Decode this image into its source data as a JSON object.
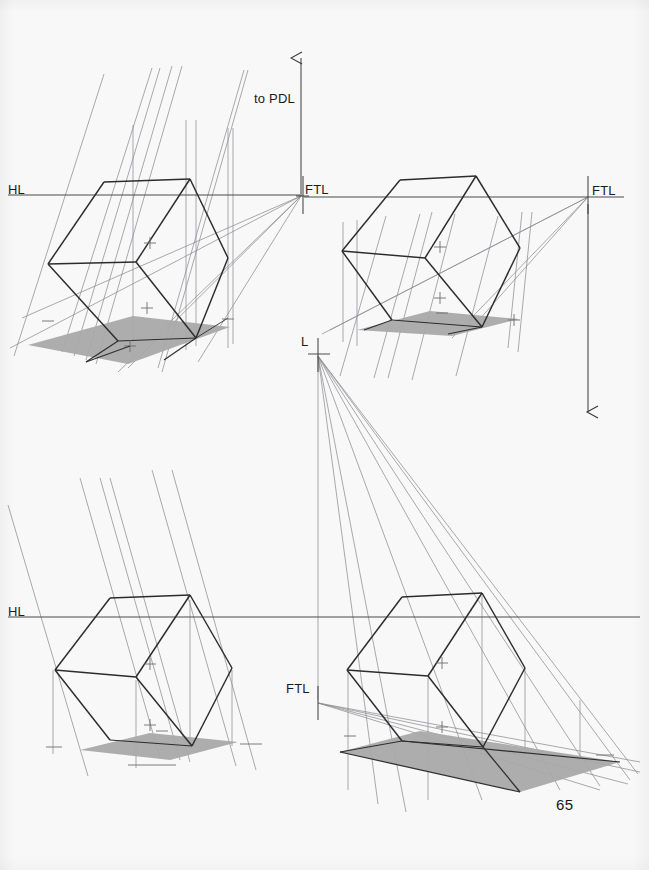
{
  "page": {
    "number": "65",
    "background_color": "#f8f8f8",
    "ink_color": "#303030",
    "construction_line_color": "#8d8d93",
    "shadow_fill_color": "#a9a9a9",
    "width": 649,
    "height": 870
  },
  "labels": {
    "hl_top_left": "HL",
    "hl_bottom_left": "HL",
    "ftl_top_left": "FTL",
    "ftl_top_right_left_edge": "FTL",
    "ftl_top_right": "FTL",
    "ftl_bottom_right": "FTL",
    "to_pdl": "to PDL",
    "light_point": "L"
  },
  "figures": [
    {
      "id": "fig-top-left",
      "name": "cube-with-cast-shadow-top-left",
      "caption_labels": [
        "HL",
        "FTL",
        "to PDL"
      ],
      "reference_lines": [
        {
          "name": "horizon-line",
          "label": "HL",
          "y": 195,
          "x1": 8,
          "x2": 300
        },
        {
          "name": "ftl-marker",
          "label": "FTL",
          "x": 301,
          "y": 195
        },
        {
          "name": "to-pdl-arrow",
          "label": "to PDL",
          "x": 301,
          "y_from": 195,
          "y_to": 52,
          "direction": "up"
        }
      ],
      "cube_vertices": {
        "top_back": [
          104,
          182
        ],
        "top_apex": [
          190,
          179
        ],
        "left": [
          48,
          264
        ],
        "center": [
          136,
          262
        ],
        "right": [
          228,
          258
        ],
        "bottom_left": [
          118,
          341
        ],
        "bottom_center": [
          196,
          338
        ],
        "bottom_right": [
          228,
          318
        ]
      },
      "shadow_polygon": [
        [
          28,
          345
        ],
        [
          133,
          316
        ],
        [
          230,
          327
        ],
        [
          128,
          364
        ]
      ]
    },
    {
      "id": "fig-top-right",
      "name": "cube-with-cast-shadow-top-right",
      "caption_labels": [
        "FTL",
        "FTL"
      ],
      "reference_lines": [
        {
          "name": "ftl-line",
          "label": "FTL",
          "y": 197,
          "x1": 304,
          "x2": 624
        },
        {
          "name": "ftl-vertical-drop-arrow",
          "x": 588,
          "y_from": 197,
          "y_to": 420,
          "direction": "down"
        }
      ],
      "cube_vertices": {
        "top_back": [
          400,
          180
        ],
        "top_apex": [
          476,
          176
        ],
        "left": [
          342,
          251
        ],
        "center": [
          425,
          258
        ],
        "right": [
          520,
          248
        ],
        "bottom_left": [
          392,
          320
        ],
        "bottom_center": [
          482,
          327
        ],
        "bottom_right": [
          500,
          312
        ]
      },
      "shadow_polygon": [
        [
          357,
          330
        ],
        [
          430,
          311
        ],
        [
          519,
          319
        ],
        [
          452,
          336
        ]
      ]
    },
    {
      "id": "fig-bottom-left",
      "name": "cube-with-cast-shadow-bottom-left",
      "caption_labels": [
        "HL"
      ],
      "reference_lines": [
        {
          "name": "horizon-line",
          "label": "HL",
          "y": 617,
          "x1": 8,
          "x2": 300
        }
      ],
      "cube_vertices": {
        "top_back": [
          110,
          598
        ],
        "top_apex": [
          190,
          595
        ],
        "left": [
          55,
          670
        ],
        "center": [
          136,
          677
        ],
        "right": [
          232,
          668
        ],
        "bottom_left": [
          110,
          740
        ],
        "bottom_center": [
          192,
          746
        ],
        "bottom_right": [
          232,
          731
        ]
      },
      "shadow_polygon": [
        [
          80,
          750
        ],
        [
          150,
          733
        ],
        [
          238,
          742
        ],
        [
          170,
          760
        ]
      ]
    },
    {
      "id": "fig-bottom-right",
      "name": "cube-with-long-cast-shadow-bottom-right",
      "caption_labels": [
        "L",
        "FTL"
      ],
      "reference_lines": [
        {
          "name": "horizon-line",
          "y": 617,
          "x1": 300,
          "x2": 640
        },
        {
          "name": "ftl-marker",
          "label": "FTL",
          "x": 318,
          "y": 703
        },
        {
          "name": "light-point",
          "label": "L",
          "x": 318,
          "y": 352
        }
      ],
      "light_source": {
        "name": "L",
        "x": 318,
        "y": 352
      },
      "cube_vertices": {
        "top_back": [
          402,
          597
        ],
        "top_apex": [
          482,
          593
        ],
        "left": [
          347,
          670
        ],
        "center": [
          428,
          676
        ],
        "right": [
          525,
          668
        ],
        "bottom_left": [
          402,
          741
        ],
        "bottom_center": [
          483,
          747
        ],
        "bottom_right": [
          525,
          731
        ]
      },
      "shadow_polygon": [
        [
          340,
          752
        ],
        [
          420,
          731
        ],
        [
          620,
          762
        ],
        [
          520,
          792
        ]
      ]
    }
  ]
}
